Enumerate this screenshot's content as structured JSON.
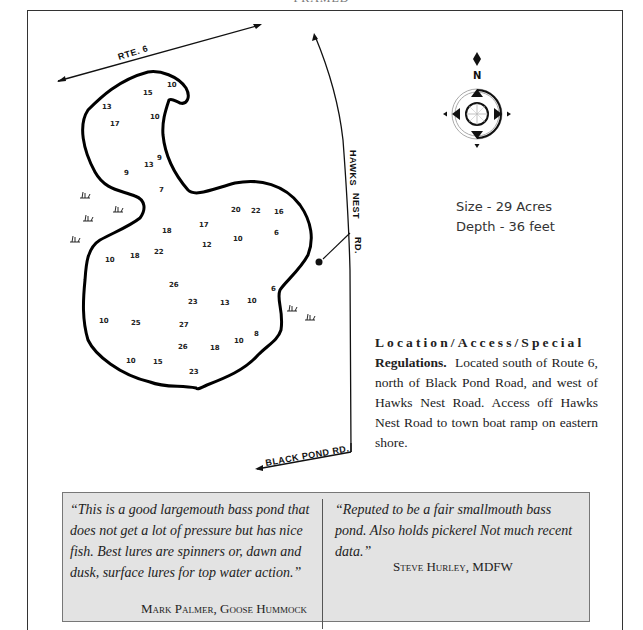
{
  "page": {
    "title": "FRAMED"
  },
  "map": {
    "roads": {
      "rte6": "RTE. 6",
      "hawks_nest": "HAWKS NEST RD.",
      "hawks_nest_parts": [
        "HAWKS",
        "NEST",
        "RD."
      ],
      "black_pond": "BLACK POND RD."
    },
    "compass": {
      "label": "N"
    },
    "depths": [
      {
        "v": "15",
        "x": 148,
        "y": 93
      },
      {
        "v": "10",
        "x": 171,
        "y": 86
      },
      {
        "v": "13",
        "x": 106,
        "y": 108
      },
      {
        "v": "17",
        "x": 113,
        "y": 126
      },
      {
        "v": "10",
        "x": 154,
        "y": 118
      },
      {
        "v": "9",
        "x": 159,
        "y": 159
      },
      {
        "v": "13",
        "x": 148,
        "y": 166
      },
      {
        "v": "9",
        "x": 126,
        "y": 174
      },
      {
        "v": "7",
        "x": 161,
        "y": 191
      },
      {
        "v": "20",
        "x": 235,
        "y": 211
      },
      {
        "v": "22",
        "x": 255,
        "y": 212
      },
      {
        "v": "16",
        "x": 278,
        "y": 212
      },
      {
        "v": "17",
        "x": 203,
        "y": 225
      },
      {
        "v": "18",
        "x": 166,
        "y": 231
      },
      {
        "v": "6",
        "x": 276,
        "y": 233
      },
      {
        "v": "10",
        "x": 237,
        "y": 239
      },
      {
        "v": "12",
        "x": 206,
        "y": 246
      },
      {
        "v": "22",
        "x": 158,
        "y": 252
      },
      {
        "v": "18",
        "x": 134,
        "y": 256
      },
      {
        "v": "10",
        "x": 109,
        "y": 260
      },
      {
        "v": "26",
        "x": 173,
        "y": 285
      },
      {
        "v": "6",
        "x": 273,
        "y": 289
      },
      {
        "v": "23",
        "x": 192,
        "y": 302
      },
      {
        "v": "13",
        "x": 224,
        "y": 303
      },
      {
        "v": "10",
        "x": 251,
        "y": 301
      },
      {
        "v": "10",
        "x": 103,
        "y": 321
      },
      {
        "v": "25",
        "x": 135,
        "y": 323
      },
      {
        "v": "27",
        "x": 183,
        "y": 325
      },
      {
        "v": "8",
        "x": 256,
        "y": 334
      },
      {
        "v": "10",
        "x": 238,
        "y": 341
      },
      {
        "v": "26",
        "x": 182,
        "y": 347
      },
      {
        "v": "18",
        "x": 214,
        "y": 348
      },
      {
        "v": "10",
        "x": 130,
        "y": 361
      },
      {
        "v": "15",
        "x": 157,
        "y": 362
      },
      {
        "v": "23",
        "x": 193,
        "y": 372
      }
    ]
  },
  "stats": {
    "size": "Size - 29 Acres",
    "depth": "Depth - 36 feet"
  },
  "location": {
    "heading_line1": "Location/Access/Special",
    "heading_line2": "Regulations.",
    "body": "Located south of Route 6, north of Black Pond Road, and west of Hawks Nest Road. Access off Hawks Nest Road to town boat ramp on eastern shore."
  },
  "quotes": [
    {
      "text": "“This is a good largemouth bass pond that does not get a lot of pressure but has nice fish. Best lures are spinners or, dawn and dusk, surface lures for top water action.”",
      "author": "Mark Palmer, Goose Hummock"
    },
    {
      "text": "“Reputed to be a fair smallmouth bass pond. Also holds pickerel Not much recent data.”",
      "author": "Steve Hurley, MDFW"
    }
  ]
}
